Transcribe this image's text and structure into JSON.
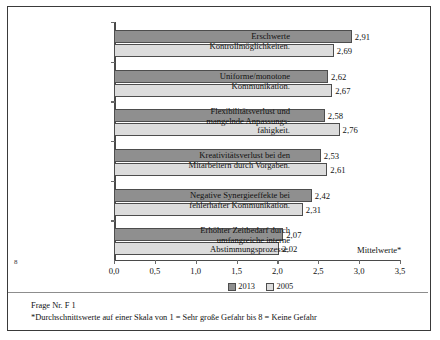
{
  "chart_data": {
    "type": "bar",
    "orientation": "horizontal",
    "title": "",
    "xlabel": "Mittelwerte*",
    "ylabel": "",
    "xlim": [
      0.0,
      3.5
    ],
    "xticks": [
      "0,0",
      "0,5",
      "1,0",
      "1,5",
      "2,0",
      "2,5",
      "3,0",
      "3,5"
    ],
    "xtick_values": [
      0.0,
      0.5,
      1.0,
      1.5,
      2.0,
      2.5,
      3.0,
      3.5
    ],
    "grid": false,
    "legend_position": "bottom",
    "categories": [
      "Erschwerte\nKontrollmöglichkeiten.",
      "Uniforme/monotone\nKommunikation.",
      "Flexibilitätsverlust und\nmangelnde Anpassungs-\nfähigkeit.",
      "Kreativitätsverlust bei den\nMitarbeitern durch Vorgaben.",
      "Negative Synergieeffekte bei\nfehlerhafter Kommunikation.",
      "Erhöhter Zeitbedarf durch\numfangreiche interne\nAbstimmungsprozesse."
    ],
    "series": [
      {
        "name": "2013",
        "color": "#8f8f8f",
        "values": [
          2.91,
          2.62,
          2.58,
          2.53,
          2.42,
          2.07
        ],
        "labels": [
          "2,91",
          "2,62",
          "2,58",
          "2,53",
          "2,42",
          "2,07"
        ]
      },
      {
        "name": "2005",
        "color": "#dcdcdc",
        "values": [
          2.69,
          2.67,
          2.76,
          2.61,
          2.31,
          2.02
        ],
        "labels": [
          "2,69",
          "2,67",
          "2,76",
          "2,61",
          "2,31",
          "2,02"
        ]
      }
    ]
  },
  "categories_lines": [
    [
      "Erschwerte",
      "Kontrollmöglichkeiten."
    ],
    [
      "Uniforme/monotone",
      "Kommunikation."
    ],
    [
      "Flexibilitätsverlust und",
      "mangelnde Anpassungs-",
      "fähigkeit."
    ],
    [
      "Kreativitätsverlust bei den",
      "Mitarbeitern durch Vorgaben."
    ],
    [
      "Negative Synergieeffekte bei",
      "fehlerhafter Kommunikation."
    ],
    [
      "Erhöhter Zeitbedarf durch",
      "umfangreiche interne",
      "Abstimmungsprozesse."
    ]
  ],
  "legend": {
    "items": [
      {
        "label": "2013"
      },
      {
        "label": "2005"
      }
    ]
  },
  "footnotes": {
    "line1": "Frage Nr. F 1",
    "line2": "*Durchschnittswerte auf einer Skala von 1 = Sehr große Gefahr bis 8 = Keine Gefahr"
  },
  "page_mark": "8",
  "colors": {
    "series_2013": "#8f8f8f",
    "series_2005": "#dcdcdc",
    "axis": "#4a4a4a",
    "frame": "#3a3a3a"
  }
}
